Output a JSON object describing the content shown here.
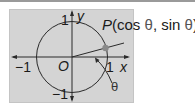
{
  "figure": {
    "point_label": {
      "name": "P",
      "open": "(",
      "x_expr": "cos",
      "sep": ", ",
      "y_expr": "sin",
      "theta": "θ",
      "close": ")"
    },
    "axes": {
      "x_label": "x",
      "y_label": "y",
      "origin_label": "O"
    },
    "ticks": {
      "pos_x": "1",
      "neg_x": "−1",
      "pos_y": "1",
      "neg_y": "−1"
    },
    "angle_label": "θ",
    "colors": {
      "background": "#d4d4d4",
      "line": "#2a2a2a",
      "point": "#8a8a8a"
    }
  }
}
